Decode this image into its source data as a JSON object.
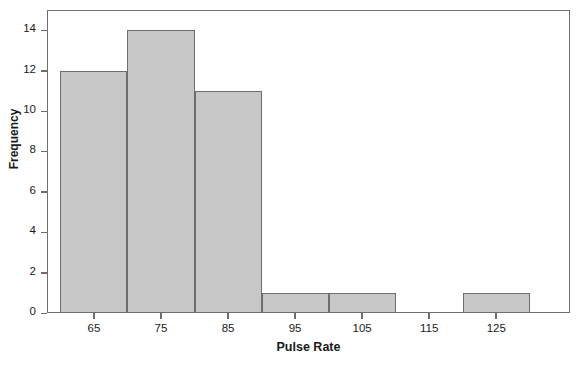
{
  "chart_data": {
    "type": "bar",
    "title": "",
    "xlabel": "Pulse Rate",
    "ylabel": "Frequency",
    "categories": [
      "65",
      "75",
      "85",
      "95",
      "105",
      "115",
      "125"
    ],
    "bin_edges": [
      60,
      70,
      80,
      90,
      100,
      110,
      120,
      130
    ],
    "values": [
      12,
      14,
      11,
      1,
      1,
      0,
      1
    ],
    "xtick_labels": [
      "65",
      "75",
      "85",
      "95",
      "105",
      "115",
      "125"
    ],
    "xtick_values": [
      65,
      75,
      85,
      95,
      105,
      115,
      125
    ],
    "ytick_labels": [
      "0",
      "2",
      "4",
      "6",
      "8",
      "10",
      "12",
      "14"
    ],
    "ytick_values": [
      0,
      2,
      4,
      6,
      8,
      10,
      12,
      14
    ],
    "xlim": [
      58,
      136
    ],
    "ylim": [
      0,
      15
    ],
    "grid": false,
    "legend": false,
    "bar_fill_color": "#c7c7c7",
    "bar_edge_color": "#6e6e6e",
    "axis_color": "#6e6e6e",
    "text_color": "#1a1a1a"
  }
}
